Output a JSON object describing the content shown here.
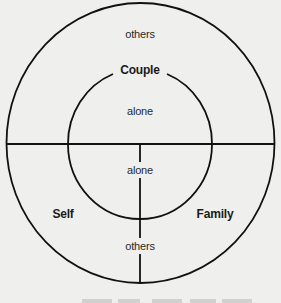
{
  "diagram": {
    "stroke_color": "#111111",
    "background_color": "#efefed",
    "outer_circle": {
      "cx": 140,
      "cy": 143,
      "rx": 134,
      "ry": 140
    },
    "inner_circle": {
      "cx": 140,
      "cy": 144,
      "rx": 72,
      "ry": 75
    },
    "labels": {
      "outer_top": "others",
      "couple": "Couple",
      "inner_top": "alone",
      "inner_bottom": "alone",
      "self": "Self",
      "family": "Family",
      "outer_bottom": "others"
    }
  }
}
